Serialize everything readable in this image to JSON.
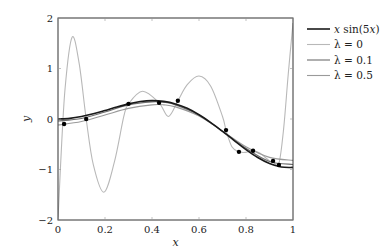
{
  "chart_data": {
    "type": "line",
    "title": "",
    "xlabel": "x",
    "ylabel": "y",
    "xlim": [
      0,
      1
    ],
    "ylim": [
      -2,
      2
    ],
    "xticks": [
      "0",
      "0.2",
      "0.4",
      "0.6",
      "0.8",
      "1"
    ],
    "yticks": [
      "−2",
      "−1",
      "0",
      "1",
      "2"
    ],
    "grid": false,
    "legend_position": "outside right, top",
    "series": [
      {
        "name": "x sin(5x)",
        "color": "#1a1a1a",
        "width": 1.6,
        "x": [
          0,
          0.05,
          0.1,
          0.15,
          0.2,
          0.25,
          0.3,
          0.35,
          0.4,
          0.45,
          0.5,
          0.55,
          0.6,
          0.65,
          0.7,
          0.75,
          0.8,
          0.85,
          0.9,
          0.95,
          1.0
        ],
        "y": [
          0,
          0.012,
          0.048,
          0.102,
          0.168,
          0.237,
          0.299,
          0.345,
          0.364,
          0.349,
          0.299,
          0.212,
          0.085,
          -0.071,
          -0.245,
          -0.427,
          -0.605,
          -0.763,
          -0.882,
          -0.951,
          -0.959
        ]
      },
      {
        "name": "λ = 0",
        "color": "#b8b8b8",
        "width": 1.1,
        "x": [
          0,
          0.01,
          0.03,
          0.06,
          0.09,
          0.12,
          0.15,
          0.195,
          0.24,
          0.28,
          0.3,
          0.36,
          0.43,
          0.47,
          0.51,
          0.55,
          0.6,
          0.65,
          0.7,
          0.715,
          0.74,
          0.77,
          0.8,
          0.83,
          0.86,
          0.9,
          0.915,
          0.94,
          0.96,
          0.98,
          1.0
        ],
        "y": [
          -2.0,
          -1.0,
          0.6,
          1.62,
          1.1,
          0.0,
          -0.9,
          -1.45,
          -0.85,
          0.05,
          0.3,
          0.55,
          0.32,
          0.05,
          0.36,
          0.68,
          0.85,
          0.65,
          0.05,
          -0.22,
          -0.55,
          -0.65,
          -0.66,
          -0.63,
          -0.68,
          -0.83,
          -0.85,
          -0.88,
          -0.2,
          0.9,
          1.9
        ]
      },
      {
        "name": "λ = 0.1",
        "color": "#6e6e6e",
        "width": 1.1,
        "x": [
          0,
          0.1,
          0.2,
          0.3,
          0.4,
          0.45,
          0.5,
          0.6,
          0.7,
          0.8,
          0.9,
          1.0
        ],
        "y": [
          -0.04,
          0.01,
          0.14,
          0.28,
          0.34,
          0.33,
          0.28,
          0.08,
          -0.24,
          -0.58,
          -0.84,
          -0.9
        ]
      },
      {
        "name": "λ = 0.5",
        "color": "#9a9a9a",
        "width": 1.1,
        "x": [
          0,
          0.1,
          0.2,
          0.3,
          0.4,
          0.45,
          0.5,
          0.6,
          0.7,
          0.8,
          0.9,
          1.0
        ],
        "y": [
          -0.12,
          -0.05,
          0.08,
          0.21,
          0.28,
          0.28,
          0.24,
          0.06,
          -0.24,
          -0.55,
          -0.76,
          -0.82
        ]
      }
    ],
    "points": {
      "name": "training samples",
      "color": "#000000",
      "x": [
        0.026,
        0.12,
        0.3,
        0.43,
        0.51,
        0.715,
        0.77,
        0.83,
        0.915,
        0.94
      ],
      "y": [
        -0.1,
        0.0,
        0.3,
        0.32,
        0.36,
        -0.22,
        -0.65,
        -0.63,
        -0.83,
        -0.91
      ]
    }
  },
  "legend": {
    "items": [
      {
        "label": "x sin(5x)",
        "color": "#1a1a1a"
      },
      {
        "label": "λ = 0",
        "color": "#b8b8b8"
      },
      {
        "label": "λ = 0.1",
        "color": "#6e6e6e"
      },
      {
        "label": "λ = 0.5",
        "color": "#9a9a9a"
      }
    ]
  },
  "axes": {
    "xlabel": "x",
    "ylabel": "y",
    "xticks": [
      "0",
      "0.2",
      "0.4",
      "0.6",
      "0.8",
      "1"
    ],
    "yticks": [
      "2",
      "1",
      "0",
      "−1",
      "−2"
    ]
  }
}
